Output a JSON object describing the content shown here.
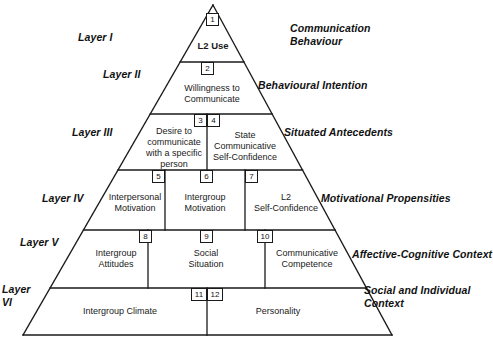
{
  "figure": {
    "shape": "pyramid",
    "stroke_color": "#1a1a1a",
    "background_color": "#ffffff",
    "apex": {
      "x": 213,
      "y": 5
    },
    "base_left": {
      "x": 23,
      "y": 335
    },
    "base_right": {
      "x": 392,
      "y": 335
    }
  },
  "layers": [
    {
      "id": "layer-1",
      "name": "Layer I",
      "side_label": "Communication\nBehaviour",
      "top_y": 5,
      "bottom_y": 62,
      "cells": [
        {
          "number": "1",
          "label": "L2 Use",
          "bold": true
        }
      ]
    },
    {
      "id": "layer-2",
      "name": "Layer II",
      "side_label": "Behavioural Intention",
      "top_y": 62,
      "bottom_y": 114,
      "cells": [
        {
          "number": "2",
          "label": "Willingness to\nCommunicate",
          "bold": false
        }
      ]
    },
    {
      "id": "layer-3",
      "name": "Layer III",
      "side_label": "Situated Antecedents",
      "top_y": 114,
      "bottom_y": 170,
      "cells": [
        {
          "number": "3",
          "label": "Desire to\ncommunicate\nwith a specific\nperson",
          "bold": false
        },
        {
          "number": "4",
          "label": "State\nCommunicative\nSelf-Confidence",
          "bold": false
        }
      ]
    },
    {
      "id": "layer-4",
      "name": "Layer IV",
      "side_label": "Motivational Propensities",
      "top_y": 170,
      "bottom_y": 230,
      "cells": [
        {
          "number": "5",
          "label": "Interpersonal\nMotivation",
          "bold": false
        },
        {
          "number": "6",
          "label": "Intergroup\nMotivation",
          "bold": false
        },
        {
          "number": "7",
          "label": "L2\nSelf-Confidence",
          "bold": false
        }
      ]
    },
    {
      "id": "layer-5",
      "name": "Layer V",
      "side_label": "Affective-Cognitive Context",
      "top_y": 230,
      "bottom_y": 288,
      "cells": [
        {
          "number": "8",
          "label": "Intergroup\nAttitudes",
          "bold": false
        },
        {
          "number": "9",
          "label": "Social\nSituation",
          "bold": false
        },
        {
          "number": "10",
          "label": "Communicative\nCompetence",
          "bold": false
        }
      ]
    },
    {
      "id": "layer-6",
      "name": "Layer\nVI",
      "side_label": "Social and Individual\nContext",
      "top_y": 288,
      "bottom_y": 335,
      "cells": [
        {
          "number": "11",
          "label": "Intergroup Climate",
          "bold": false
        },
        {
          "number": "12",
          "label": "Personality",
          "bold": false
        }
      ]
    }
  ]
}
